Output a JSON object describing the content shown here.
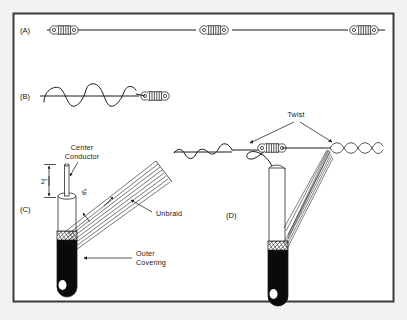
{
  "figure": {
    "border_color": "#3a3a3a",
    "background_color": "#f3f2f0",
    "ink_color": "#1b1b1b",
    "jacket_color": "#0a0a0a"
  },
  "panels": [
    {
      "id": "A",
      "label": "(A)",
      "caption": "Coaxial feedline with three ferrite chokes in line",
      "choke_count": 3
    },
    {
      "id": "B",
      "label": "(B)",
      "caption": "Wire wound helically around conductor ending at choke",
      "choke_count": 1
    },
    {
      "id": "C",
      "label": "(C)",
      "caption": "Prepared cable end with center conductor and unbraided shield"
    },
    {
      "id": "D",
      "label": "(D)",
      "caption": "Assembled element: coiled conductor, choke, twisted braid",
      "choke_count": 1
    }
  ],
  "callouts": {
    "center_conductor": {
      "line1": "Center",
      "line2": "Conductor"
    },
    "unbraid": "Unbraid",
    "outer_covering": {
      "line1": "Outer",
      "line2": "Covering"
    },
    "twist": "Twist"
  },
  "dimensions": [
    {
      "name": "center-conductor-length",
      "value": "2\"",
      "panel": "C"
    },
    {
      "name": "unbraid-length",
      "value": "6\"",
      "panel": "C"
    }
  ]
}
